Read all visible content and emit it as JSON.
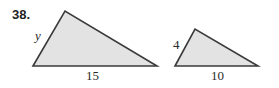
{
  "problem": {
    "number": "38."
  },
  "figures": [
    {
      "name": "large-triangle",
      "vertices": [
        [
          33,
          66
        ],
        [
          65,
          11
        ],
        [
          157,
          66
        ]
      ],
      "labels": {
        "side_left": "y",
        "base": "15"
      }
    },
    {
      "name": "small-triangle",
      "vertices": [
        [
          175,
          66
        ],
        [
          195,
          29
        ],
        [
          258,
          66
        ]
      ],
      "labels": {
        "side_left": "4",
        "base": "10"
      }
    }
  ],
  "colors": {
    "fill": "#e3e3e3",
    "stroke": "#3a3a3a",
    "text": "#2a2a2a"
  }
}
